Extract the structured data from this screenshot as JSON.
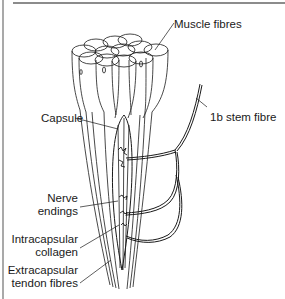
{
  "diagram": {
    "labels": {
      "muscle_fibres": "Muscle fibres",
      "stem_fibre": "1b stem fibre",
      "capsule": "Capsule",
      "nerve_endings_1": "Nerve",
      "nerve_endings_2": "endings",
      "intracapsular_1": "Intracapsular",
      "intracapsular_2": "collagen",
      "extracapsular_1": "Extracapsular",
      "extracapsular_2": "tendon fibres"
    },
    "colors": {
      "line": "#1a1a1a",
      "frame": "#a9a9a9",
      "background": "#ffffff"
    }
  }
}
